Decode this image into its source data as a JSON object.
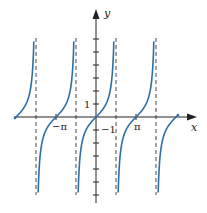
{
  "chart_data": {
    "type": "line",
    "title": "",
    "function": "y = tan x",
    "xlabel": "x",
    "ylabel": "y",
    "x_tick_labels": [
      "−π",
      "π"
    ],
    "y_tick_labels": [
      "1",
      "−1"
    ],
    "xlim": [
      -6.0,
      6.0
    ],
    "ylim": [
      -6.0,
      6.0
    ],
    "asymptotes": [
      -4.712,
      -1.571,
      1.571,
      4.712
    ],
    "asymptote_labels": [
      "x = −3π/2",
      "x = −π/2",
      "x = π/2",
      "x = 3π/2"
    ],
    "grid": false,
    "series": [
      {
        "name": "tan x",
        "color": "#2f6ea6",
        "x": [
          -4.712,
          -4.0,
          -3.5,
          -3.1416,
          -2.8,
          -2.5,
          -2.0,
          -1.6
        ],
        "y": [
          null,
          -1.158,
          -0.375,
          0,
          0.356,
          0.747,
          2.185,
          34.2
        ]
      },
      {
        "name": "tan x branch",
        "color": "#2f6ea6",
        "x": [
          -1.55,
          -1.2,
          -0.8,
          0,
          0.8,
          1.2,
          1.55
        ],
        "y": [
          -48.1,
          -2.572,
          -1.03,
          0,
          1.03,
          2.572,
          48.1
        ]
      }
    ],
    "colors": {
      "curve": "#2f6ea6",
      "axis": "#222222",
      "asymptote": "#333333"
    }
  },
  "labels": {
    "x_axis": "x",
    "y_axis": "y",
    "neg_pi": "−π",
    "pi": "π",
    "one": "1",
    "neg_one": "−1"
  }
}
